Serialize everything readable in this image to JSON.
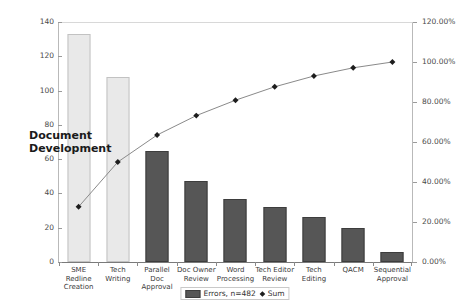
{
  "chart_data": {
    "type": "bar",
    "title": "",
    "xlabel": "",
    "ylabel": "",
    "categories": [
      "SME Redline Creation",
      "Tech Writing",
      "Parallel Doc Approval",
      "Doc Owner Review",
      "Word Processing",
      "Tech Editor Review",
      "Tech Editing",
      "QACM",
      "Sequential Approval"
    ],
    "series": [
      {
        "name": "Errors, n=482",
        "type": "bar",
        "axis": "left",
        "values": [
          133,
          108,
          65,
          47,
          37,
          32,
          26,
          20,
          6
        ]
      },
      {
        "name": "Sum",
        "type": "line",
        "axis": "right",
        "values": [
          27.6,
          50.0,
          63.5,
          73.2,
          80.9,
          87.6,
          93.0,
          97.1,
          100.0
        ]
      }
    ],
    "ylim": [
      0,
      140
    ],
    "y2lim": [
      0,
      120
    ],
    "yticks": [
      "0",
      "20",
      "40",
      "60",
      "80",
      "100",
      "120",
      "140"
    ],
    "y2ticks": [
      "0.00%",
      "20.00%",
      "40.00%",
      "60.00%",
      "80.00%",
      "100.00%",
      "120.00%"
    ],
    "grid": false,
    "legend_position": "bottom",
    "annotations": [
      {
        "text": "Document\nDevelopment",
        "target": "first-two-bars"
      }
    ],
    "bar_colors": {
      "highlight": "#e9e9e9",
      "standard": "#565656",
      "highlight_count": 2
    },
    "line_color": "#8a8a8a",
    "marker_color": "#1d1d1d"
  },
  "legend": {
    "bar_label": "Errors, n=482",
    "line_label": "Sum"
  },
  "annotation": {
    "line1": "Document",
    "line2": "Development"
  }
}
